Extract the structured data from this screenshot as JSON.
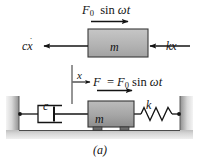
{
  "figure": {
    "caption": "(a)",
    "labels": {
      "force_top": "F0 sin ωt",
      "damping_force": "cẋ",
      "mass_fbd": "m",
      "spring_force": "kx",
      "displacement": "x",
      "force_system": "F = F0 sin ωt",
      "damper": "c",
      "mass_system": "m",
      "spring": "k"
    },
    "colors": {
      "mass_fill": "#a8a8a8",
      "mass_fill_fbd": "#b4b4b4",
      "stroke": "#1a1a1a",
      "wall_light": "#f2f2f2",
      "wall_dark": "#9a9a9a",
      "ground": "#c9c9c9",
      "background": "#ffffff"
    }
  }
}
